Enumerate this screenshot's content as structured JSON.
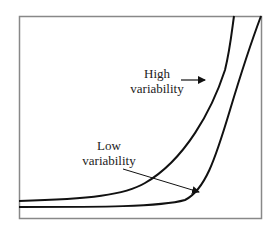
{
  "diagram": {
    "type": "curve-comparison",
    "curves": [
      {
        "name": "High variability",
        "label_line1": "High",
        "label_line2": "variability"
      },
      {
        "name": "Low variability",
        "label_line1": "Low",
        "label_line2": "variability"
      }
    ],
    "colors": {
      "frame": "#888888",
      "curve": "#111111",
      "background": "#ffffff"
    }
  }
}
